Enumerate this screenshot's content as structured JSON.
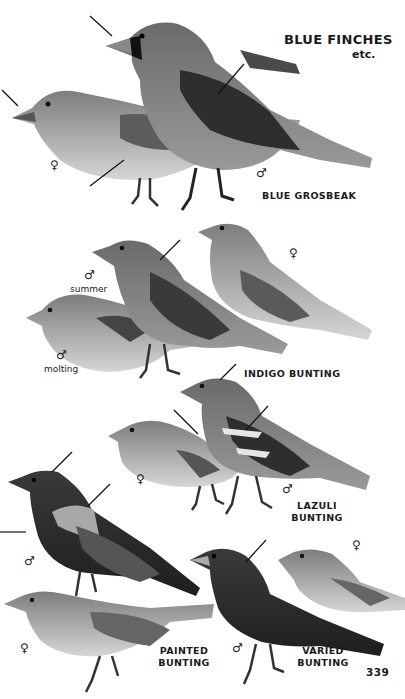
{
  "page": {
    "title": "BLUE FINCHES",
    "subtitle": "etc.",
    "page_number": "339"
  },
  "species": [
    {
      "name": "BLUE GROSBEAK",
      "male_symbol": "♂",
      "female_symbol": "♀"
    },
    {
      "name": "INDIGO BUNTING",
      "male_symbol": "♂",
      "male_note": "summer",
      "molting_symbol": "♂",
      "molting_note": "molting",
      "female_symbol": "♀"
    },
    {
      "name_line1": "LAZULI",
      "name_line2": "BUNTING",
      "male_symbol": "♂",
      "female_symbol": "♀"
    },
    {
      "name_line1": "PAINTED",
      "name_line2": "BUNTING",
      "male_symbol": "♂",
      "female_symbol": "♀"
    },
    {
      "name_line1": "VARIED",
      "name_line2": "BUNTING",
      "male_symbol": "♂",
      "female_symbol": "♀"
    }
  ],
  "colors": {
    "background": "#ffffff",
    "text": "#1a1a1a",
    "bird_dark": "#2a2a2a",
    "bird_mid": "#6e6e6e",
    "bird_light": "#b8b8b8"
  }
}
